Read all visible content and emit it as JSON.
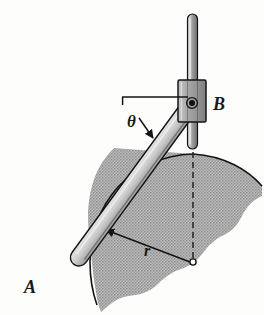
{
  "figure": {
    "domain": "mechanical-engineering-diagram",
    "background_color": "#fdfdfc"
  },
  "labels": {
    "point_a": "A",
    "point_b": "B",
    "angle_theta": "θ",
    "radius_r": "r"
  },
  "colors": {
    "outline": "#141414",
    "arm_fill": "#c9c9c9",
    "arm_highlight": "#e2e2e2",
    "arm_shadow": "#8f8f8f",
    "rod_fill": "#9c9c9c",
    "rod_highlight": "#d6d6d6",
    "collar_fill": "#b0b0b0",
    "region_fill": "#a9a9a9",
    "pin_fill": "#111111",
    "dashed_line": "#1a1a1a"
  },
  "geometry": {
    "pin_b": {
      "x": 192,
      "y": 103
    },
    "point_a": {
      "x": 48,
      "y": 272
    },
    "center_o": {
      "x": 193,
      "y": 262
    },
    "radius_px": 108,
    "arm_angle_deg": 54,
    "vertical_rod": {
      "x": 192,
      "top_y": 14,
      "bottom_y": 149,
      "width": 10
    },
    "collar": {
      "x": 178,
      "y": 80,
      "width": 28,
      "height": 42
    },
    "theta_ref_line": {
      "x1": 122,
      "x2": 188,
      "y": 97
    },
    "dashed_line": {
      "x": 193,
      "y1": 148,
      "y2": 264
    }
  },
  "annotations": {
    "theta_description": "angle of arm AB measured from horizontal reference line at pin B",
    "r_description": "radial distance from center O to the cam arc surface",
    "arc_description": "shaded cam/ground region bounded by a circular arc of radius r centered at O"
  },
  "elements": [
    {
      "name": "vertical-guide-rod",
      "kind": "rod"
    },
    {
      "name": "slider-collar-b",
      "kind": "collar"
    },
    {
      "name": "pivot-pin-b",
      "kind": "pin"
    },
    {
      "name": "arm-ab",
      "kind": "link"
    },
    {
      "name": "shaded-cam-region",
      "kind": "region"
    },
    {
      "name": "radius-dimension",
      "kind": "dimension"
    },
    {
      "name": "theta-angle-indicator",
      "kind": "dimension"
    },
    {
      "name": "center-dashed-line",
      "kind": "construction"
    }
  ]
}
